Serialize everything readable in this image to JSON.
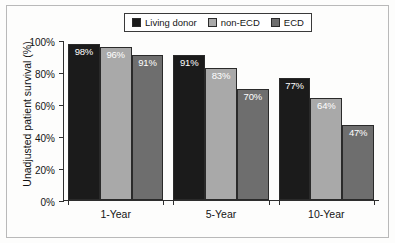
{
  "chart_data": {
    "type": "bar",
    "title": "",
    "xlabel": "",
    "ylabel": "Unadjusted patient survival (%)",
    "categories": [
      "1-Year",
      "5-Year",
      "10-Year"
    ],
    "ylim": [
      0,
      100
    ],
    "ytick_labels": [
      "0%",
      "20%",
      "40%",
      "60%",
      "80%",
      "100%"
    ],
    "ytick_values": [
      0,
      20,
      40,
      60,
      80,
      100
    ],
    "grid": false,
    "legend_position": "top-center",
    "series": [
      {
        "name": "Living donor",
        "color": "#1b1b1b",
        "values": [
          98,
          91,
          77
        ],
        "labels": [
          "98%",
          "91%",
          "77%"
        ]
      },
      {
        "name": "non-ECD",
        "color": "#a9a9a9",
        "values": [
          96,
          83,
          64
        ],
        "labels": [
          "96%",
          "83%",
          "64%"
        ]
      },
      {
        "name": "ECD",
        "color": "#6e6e6e",
        "values": [
          91,
          70,
          47
        ],
        "labels": [
          "91%",
          "70%",
          "47%"
        ]
      }
    ]
  }
}
